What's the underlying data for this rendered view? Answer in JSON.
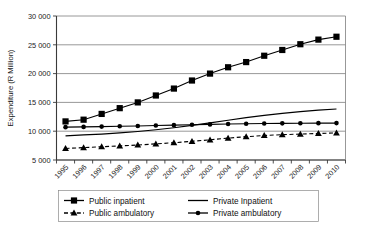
{
  "chart_data": {
    "type": "line",
    "title": "",
    "xlabel": "",
    "ylabel": "Expenditure (R Million)",
    "grid": true,
    "legend_position": "bottom",
    "ylim": [
      5000,
      30000
    ],
    "ytick_step": 5000,
    "ytick_labels": [
      "5 000",
      "10 000",
      "15 000",
      "20 000",
      "25 000",
      "30 000"
    ],
    "ytick_values": [
      5000,
      10000,
      15000,
      20000,
      25000,
      30000
    ],
    "categories": [
      "1995",
      "1996",
      "1997",
      "1998",
      "1999",
      "2000",
      "2001",
      "2002",
      "2003",
      "2004",
      "2005",
      "2006",
      "2007",
      "2008",
      "2009",
      "2010"
    ],
    "series": [
      {
        "name": "Public inpatient",
        "marker": "square",
        "dash": "solid",
        "color": "#000000",
        "values": [
          11700,
          12000,
          13000,
          14000,
          15000,
          16200,
          17400,
          18800,
          20000,
          21100,
          22000,
          23100,
          24100,
          25100,
          25900,
          26400
        ]
      },
      {
        "name": "Public  ambulatory",
        "marker": "triangle",
        "dash": "dashed",
        "color": "#000000",
        "values": [
          7000,
          7150,
          7300,
          7450,
          7600,
          7800,
          8000,
          8250,
          8500,
          8800,
          9050,
          9250,
          9400,
          9500,
          9600,
          9700
        ]
      },
      {
        "name": "Private Inpatient",
        "marker": "none",
        "dash": "solid",
        "color": "#000000",
        "values": [
          9200,
          9350,
          9500,
          9700,
          9950,
          10250,
          10600,
          11000,
          11450,
          11900,
          12350,
          12750,
          13100,
          13400,
          13650,
          13850
        ]
      },
      {
        "name": "Private ambulatory",
        "marker": "circle",
        "dash": "solid",
        "color": "#000000",
        "values": [
          10700,
          10750,
          10800,
          10850,
          10900,
          10980,
          11050,
          11120,
          11180,
          11240,
          11300,
          11330,
          11360,
          11380,
          11400,
          11410
        ]
      }
    ]
  },
  "legend": {
    "entries": [
      {
        "label": "Public inpatient"
      },
      {
        "label": "Public  ambulatory"
      },
      {
        "label": "Private Inpatient"
      },
      {
        "label": "Private ambulatory"
      }
    ]
  },
  "axis": {
    "y_title": "Expenditure (R Million)"
  }
}
